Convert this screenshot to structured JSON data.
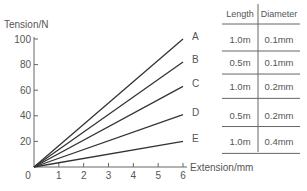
{
  "chart_data": {
    "type": "line",
    "title": "",
    "xlabel": "Extension/mm",
    "ylabel": "Tension/N",
    "xlim": [
      0,
      6
    ],
    "ylim": [
      0,
      100
    ],
    "x_ticks": [
      "0",
      "1",
      "2",
      "3",
      "4",
      "5",
      "6"
    ],
    "y_ticks": [
      "20",
      "40",
      "60",
      "80",
      "100"
    ],
    "grid": false,
    "series": [
      {
        "name": "A",
        "x": [
          0,
          6
        ],
        "y": [
          0,
          100
        ]
      },
      {
        "name": "B",
        "x": [
          0,
          6
        ],
        "y": [
          0,
          82
        ]
      },
      {
        "name": "C",
        "x": [
          0,
          6
        ],
        "y": [
          0,
          63
        ]
      },
      {
        "name": "D",
        "x": [
          0,
          6
        ],
        "y": [
          0,
          41
        ]
      },
      {
        "name": "E",
        "x": [
          0,
          6
        ],
        "y": [
          0,
          20
        ]
      }
    ],
    "table": {
      "headers": [
        "Length",
        "Diameter"
      ],
      "rows": [
        {
          "label": "A",
          "length": "1.0m",
          "diameter": "0.1mm"
        },
        {
          "label": "B",
          "length": "0.5m",
          "diameter": "0.1mm"
        },
        {
          "label": "C",
          "length": "1.0m",
          "diameter": "0.2mm"
        },
        {
          "label": "D",
          "length": "0.5m",
          "diameter": "0.2mm"
        },
        {
          "label": "E",
          "length": "1.0m",
          "diameter": "0.4mm"
        }
      ]
    }
  },
  "colors": {
    "line": "#333333",
    "text": "#555555",
    "rule": "#666666"
  }
}
